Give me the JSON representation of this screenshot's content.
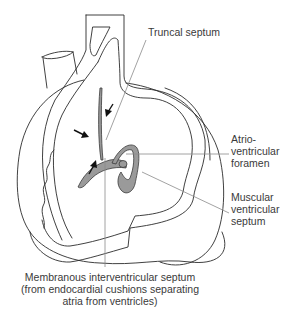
{
  "diagram": {
    "colors": {
      "outline": "#2b2b2b",
      "septum_fill": "#9a9a9a",
      "leader_line": "#8a8a8a",
      "label_text": "#3a3a3a",
      "arrows": "#111111"
    },
    "labels": {
      "truncal_septum": "Truncal septum",
      "av_foramen": [
        "Atrio-",
        "ventricular",
        "foramen"
      ],
      "muscular_septum": [
        "Muscular",
        "ventricular",
        "septum"
      ],
      "membranous_septum": [
        "Membranous interventricular septum",
        "(from endocardial cushions separating",
        "atria from ventricles)"
      ]
    },
    "arrows": [
      {
        "name": "arrow-left",
        "direction": "right-down"
      },
      {
        "name": "arrow-top",
        "direction": "left-down"
      },
      {
        "name": "arrow-bottom",
        "direction": "up-right"
      }
    ]
  }
}
